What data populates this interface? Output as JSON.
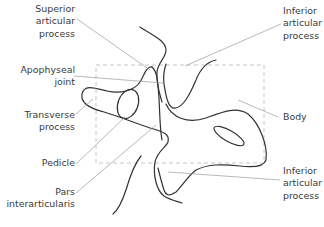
{
  "diagram": {
    "type": "anatomical-line-drawing",
    "colors": {
      "outline": "#333333",
      "leader": "#9a9a9a",
      "box": "#b8b8b8",
      "text": "#3a3a3a"
    },
    "labels": [
      {
        "id": "superior-articular-process",
        "text": "Superior\narticular\nprocess"
      },
      {
        "id": "apophyseal-joint",
        "text": "Apophyseal\njoint"
      },
      {
        "id": "transverse-process",
        "text": "Transverse\nprocess"
      },
      {
        "id": "pedicle",
        "text": "Pedicle"
      },
      {
        "id": "pars-interarticularis",
        "text": "Pars\ninterarticularis"
      },
      {
        "id": "inferior-articular-process-top",
        "text": "Inferior\narticular\nprocess"
      },
      {
        "id": "body",
        "text": "Body"
      },
      {
        "id": "inferior-articular-process-bottom",
        "text": "Inferior\narticular\nprocess"
      }
    ]
  }
}
